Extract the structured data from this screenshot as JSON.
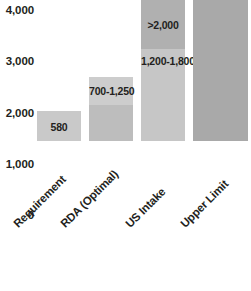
{
  "chart_data": {
    "type": "bar",
    "title": "",
    "subtitle": "",
    "xlabel": "",
    "ylabel": "",
    "ylim": [
      0,
      4000
    ],
    "grid": false,
    "legend": null,
    "y_ticks": [
      "0",
      "1,000",
      "2,000",
      "3,000",
      "4,000"
    ],
    "y_tick_values": [
      0,
      1000,
      2000,
      3000,
      4000
    ],
    "categories": [
      "Requirement",
      "RDA (Optimal)",
      "US Intake",
      "Upper Limit"
    ],
    "values": [
      580,
      1250,
      2800,
      4000
    ],
    "bars": [
      {
        "category": "Requirement",
        "total": 580,
        "segments": [
          {
            "from": 0,
            "to": 580,
            "label": "580",
            "color": "#c9c9c9"
          }
        ]
      },
      {
        "category": "RDA (Optimal)",
        "total": 1250,
        "segments": [
          {
            "from": 0,
            "to": 700,
            "label": "",
            "color": "#bdbdbd"
          },
          {
            "from": 700,
            "to": 1250,
            "label": "700-1,250",
            "color": "#cdcdcd"
          }
        ]
      },
      {
        "category": "US Intake",
        "total": 2800,
        "segments": [
          {
            "from": 0,
            "to": 1800,
            "label": "1,200-1,800",
            "color": "#c6c6c6"
          },
          {
            "from": 1800,
            "to": 2800,
            "label": ">2,000",
            "color": "#b0b0b0"
          }
        ]
      },
      {
        "category": "Upper Limit",
        "total": 4000,
        "segments": [
          {
            "from": 0,
            "to": 4000,
            "label": "3,000-4,000",
            "color": "#a9a9a9"
          }
        ]
      }
    ],
    "colors": {
      "background": "#ffffff",
      "text": "#231f20",
      "bar_light": "#cdcdcd",
      "bar_medium": "#bdbdbd",
      "bar_dark": "#a9a9a9"
    }
  }
}
